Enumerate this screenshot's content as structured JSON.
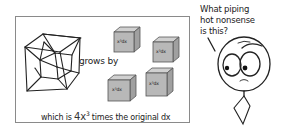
{
  "comic": {
    "panel": {
      "hypercube_label": "tesseract-drawing",
      "grows_text": "grows by",
      "cubes": [
        {
          "label": "x³dx",
          "position": "top-left"
        },
        {
          "label": "x³dx",
          "position": "top-right"
        },
        {
          "label": "x³dx",
          "position": "bottom-left"
        },
        {
          "label": "x³dx",
          "position": "bottom-right"
        }
      ],
      "caption": {
        "before": "which is ",
        "coef": "4x",
        "exp": "3",
        "after": " times the original dx"
      }
    },
    "character": {
      "speech": "What piping\nhot nonsense\nis this?"
    },
    "colors": {
      "line": "#222222",
      "cube_fill": "#b8b8b8",
      "cube_top": "#d0d0d0",
      "cube_side": "#a0a0a0",
      "panel_border": "#8a8a8a"
    }
  }
}
